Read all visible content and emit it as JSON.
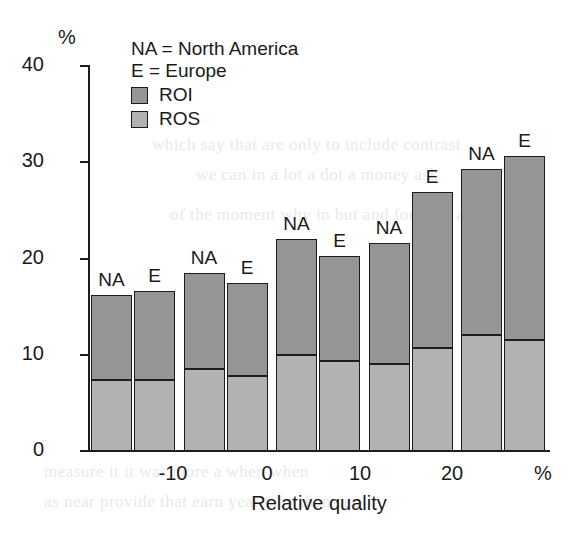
{
  "chart_data": {
    "type": "bar",
    "title": "",
    "subtype": "grouped-stacked-bar",
    "xlabel": "Relative quality",
    "ylabel": "%",
    "y_unit_label": "%",
    "x_unit_label": "%",
    "ylim": [
      0,
      40
    ],
    "y_ticks": [
      0,
      10,
      20,
      30,
      40
    ],
    "x_ticks": [
      "-10",
      "0",
      "10",
      "20",
      "%"
    ],
    "grid": false,
    "legend_position": "top-left",
    "legend": {
      "notes": [
        "NA = North America",
        "E = Europe"
      ],
      "series": [
        {
          "name": "ROI",
          "color": "#959595"
        },
        {
          "name": "ROS",
          "color": "#b2b2b2"
        }
      ]
    },
    "stack_order": [
      "ROS",
      "ROI"
    ],
    "groups": [
      {
        "name": "group-1",
        "bars": [
          {
            "region": "NA",
            "ROS": 7.4,
            "ROI": 8.8,
            "total": 16.2
          },
          {
            "region": "E",
            "ROS": 7.4,
            "ROI": 9.2,
            "total": 16.6
          }
        ]
      },
      {
        "name": "group-2",
        "tick": "-10",
        "bars": [
          {
            "region": "NA",
            "ROS": 8.5,
            "ROI": 9.9,
            "total": 18.4
          },
          {
            "region": "E",
            "ROS": 7.8,
            "ROI": 9.6,
            "total": 17.4
          }
        ]
      },
      {
        "name": "group-3",
        "tick": "0",
        "bars": [
          {
            "region": "NA",
            "ROS": 9.9,
            "ROI": 12.1,
            "total": 22.0
          },
          {
            "region": "E",
            "ROS": 9.3,
            "ROI": 10.9,
            "total": 20.2
          }
        ]
      },
      {
        "name": "group-4",
        "tick": "10",
        "bars": [
          {
            "region": "NA",
            "ROS": 9.0,
            "ROI": 12.6,
            "total": 21.6
          },
          {
            "region": "E",
            "ROS": 10.7,
            "ROI": 16.1,
            "total": 26.8
          }
        ]
      },
      {
        "name": "group-5",
        "tick": "20",
        "bars": [
          {
            "region": "NA",
            "ROS": 12.0,
            "ROI": 17.2,
            "total": 29.2
          },
          {
            "region": "E",
            "ROS": 11.5,
            "ROI": 19.1,
            "total": 30.6
          }
        ]
      }
    ]
  },
  "colors": {
    "roi": "#959595",
    "ros": "#b2b2b2",
    "axis": "#1d1d1d",
    "text": "#1a1a1a",
    "background": "#ffffff"
  },
  "axis": {
    "y_unit": "%",
    "y_labels": [
      "40",
      "30",
      "20",
      "10",
      "0"
    ],
    "x_labels": [
      "-10",
      "0",
      "10",
      "20",
      "%"
    ],
    "x_title": "Relative quality"
  },
  "legend_ui": {
    "line1": "NA = North America",
    "line2": "E = Europe",
    "item_roi": "ROI",
    "item_ros": "ROS"
  },
  "bar_labels": [
    "NA",
    "E",
    "NA",
    "E",
    "NA",
    "E",
    "NA",
    "E",
    "NA",
    "E"
  ],
  "page_bleed": [
    "which say that are only to include contrast",
    "we can in a lot a dot a money ask",
    "of the moment why in but and for only at",
    "measure it it was more a when when",
    "as near provide that earn year may than can"
  ]
}
